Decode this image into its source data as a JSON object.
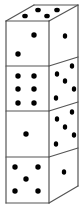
{
  "diagram": {
    "title": "Stack of four dice",
    "colors": {
      "stroke": "#555555",
      "dot": "#000000",
      "face": "#ffffff"
    },
    "geometry": {
      "front": {
        "left": 6,
        "right": 49,
        "top": 21,
        "bottom": 203
      },
      "back_top": {
        "left": 34,
        "right": 78,
        "y": 5
      },
      "side_right_x": 78,
      "side_bottom_y": 186
    },
    "dividers": [
      {
        "front_y": 66,
        "side_y": 57
      },
      {
        "front_y": 111,
        "side_y": 102
      },
      {
        "front_y": 157,
        "side_y": 148
      }
    ],
    "top_face": {
      "pips": 4,
      "dots": [
        [
          25,
          16
        ],
        [
          38,
          10
        ],
        [
          47,
          16
        ],
        [
          57,
          10
        ]
      ]
    },
    "dice": [
      {
        "label": "Die 1 (top)",
        "front": {
          "pips": 2,
          "dots": [
            [
              34,
              35
            ],
            [
              18,
              54
            ]
          ]
        },
        "side": {
          "pips": 1,
          "dots": [
            [
              65,
              36
            ]
          ]
        }
      },
      {
        "label": "Die 2",
        "front": {
          "pips": 6,
          "dots": [
            [
              18,
              76
            ],
            [
              34,
              76
            ],
            [
              18,
              89
            ],
            [
              34,
              89
            ],
            [
              18,
              103
            ],
            [
              34,
              103
            ]
          ]
        },
        "side": {
          "pips": 5,
          "dots": [
            [
              72,
              66
            ],
            [
              57,
              74
            ],
            [
              65,
              81
            ],
            [
              74,
              89
            ],
            [
              56,
              98
            ]
          ]
        }
      },
      {
        "label": "Die 3",
        "front": {
          "pips": 1,
          "dots": [
            [
              26,
              134
            ]
          ]
        },
        "side": {
          "pips": 5,
          "dots": [
            [
              72,
              112
            ],
            [
              57,
              119
            ],
            [
              65,
              127
            ],
            [
              74,
              135
            ],
            [
              56,
              144
            ]
          ]
        }
      },
      {
        "label": "Die 4 (bottom)",
        "front": {
          "pips": 5,
          "dots": [
            [
              15,
              167
            ],
            [
              38,
              167
            ],
            [
              26,
              179
            ],
            [
              15,
              191
            ],
            [
              38,
              191
            ]
          ]
        },
        "side": {
          "pips": 1,
          "dots": [
            [
              64,
              172
            ]
          ]
        }
      }
    ]
  }
}
